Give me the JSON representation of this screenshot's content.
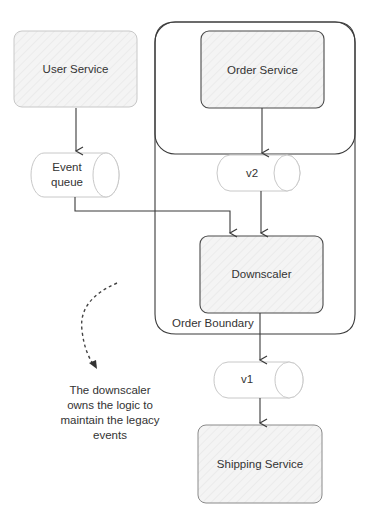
{
  "diagram": {
    "nodes": {
      "user_service": "User Service",
      "order_service": "Order Service",
      "downscaler": "Downscaler",
      "shipping_service": "Shipping Service",
      "event_queue": "Event queue",
      "event_queue_line1": "Event",
      "event_queue_line2": "queue",
      "v2": "v2",
      "v1": "v1"
    },
    "boundary_label": "Order Boundary",
    "annotation": {
      "line1": "The downscaler",
      "line2": "owns the logic to",
      "line3": "maintain the legacy",
      "line4": "events"
    },
    "edges": [
      {
        "from": "User Service",
        "to": "Event queue"
      },
      {
        "from": "Event queue",
        "to": "Downscaler"
      },
      {
        "from": "Order Service",
        "to": "v2"
      },
      {
        "from": "v2",
        "to": "Downscaler"
      },
      {
        "from": "Downscaler",
        "to": "v1"
      },
      {
        "from": "v1",
        "to": "Shipping Service"
      }
    ],
    "colors": {
      "stroke": "#3a3a3a",
      "fill": "#f3f3f3",
      "text": "#333333"
    }
  }
}
